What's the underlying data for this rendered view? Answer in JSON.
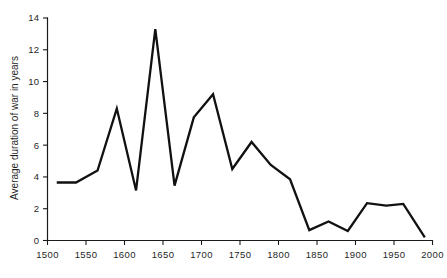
{
  "chart_data": {
    "type": "line",
    "title": "",
    "subtitle": "",
    "xlabel": "",
    "ylabel": "Average duration of war in years",
    "xlim": [
      1500,
      2000
    ],
    "ylim": [
      0,
      14
    ],
    "xticks": [
      1500,
      1550,
      1600,
      1650,
      1700,
      1750,
      1800,
      1850,
      1900,
      1950,
      2000
    ],
    "xtick_labels": [
      "1500",
      "1550",
      "1600",
      "1650",
      "1700",
      "1750",
      "1800",
      "1850",
      "1900",
      "1950",
      "2000"
    ],
    "yticks": [
      0,
      2,
      4,
      6,
      8,
      10,
      12,
      14
    ],
    "ytick_labels": [
      "0",
      "2",
      "4",
      "6",
      "8",
      "10",
      "12",
      "14"
    ],
    "grid": false,
    "legend": false,
    "legend_position": "none",
    "line_color": "#111111",
    "series": [
      {
        "name": "Average duration of war",
        "x": [
          1512,
          1537,
          1565,
          1590,
          1615,
          1640,
          1665,
          1690,
          1715,
          1740,
          1765,
          1790,
          1815,
          1840,
          1865,
          1890,
          1915,
          1940,
          1962,
          1990
        ],
        "values": [
          3.65,
          3.65,
          4.4,
          8.3,
          3.15,
          13.3,
          3.45,
          7.75,
          9.2,
          4.5,
          6.2,
          4.75,
          3.85,
          0.65,
          1.2,
          0.6,
          2.35,
          2.2,
          2.3,
          0.2
        ]
      }
    ],
    "annotations": []
  },
  "figure": {
    "ghost_caption": ""
  }
}
